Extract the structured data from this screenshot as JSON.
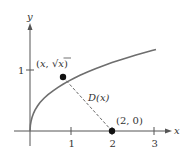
{
  "diagram": {
    "colors": {
      "axis": "#555555",
      "curve": "#6e6e6e",
      "segment": "#666666",
      "point": "#111111",
      "text": "#333333"
    },
    "axes": {
      "x_label": "x",
      "y_label": "y",
      "x_ticks": [
        "1",
        "2",
        "3"
      ],
      "y_ticks": [
        "1"
      ]
    },
    "curve": {
      "equation": "y = √x",
      "x_range": [
        0,
        3.07
      ]
    },
    "points": [
      {
        "label_prefix": "(x, ",
        "label_sqrt": "√x",
        "label_suffix": ")",
        "x": 0.8,
        "y": 0.894
      },
      {
        "label": "(2, 0)",
        "x": 2,
        "y": 0
      }
    ],
    "segment_label": "D(x)",
    "segment_label_italic_part": "D",
    "segment_label_arg": "(x)"
  }
}
